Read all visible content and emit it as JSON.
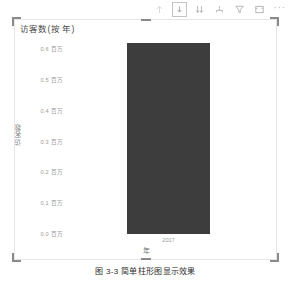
{
  "toolbar": {
    "buttons": [
      {
        "name": "drill-up-icon",
        "label": "向上钻取",
        "state": "faint"
      },
      {
        "name": "drill-down-icon",
        "label": "向下钻取",
        "state": "active"
      },
      {
        "name": "expand-all-down-icon",
        "label": "展开下一级",
        "state": "normal"
      },
      {
        "name": "drill-hierarchy-icon",
        "label": "下一级别",
        "state": "normal"
      },
      {
        "name": "filter-icon",
        "label": "筛选器",
        "state": "normal"
      },
      {
        "name": "focus-mode-icon",
        "label": "聚焦模式",
        "state": "normal"
      },
      {
        "name": "more-options-icon",
        "label": "更多选项",
        "state": "normal"
      }
    ],
    "more_glyph": "···"
  },
  "visual": {
    "title": "访客数(按 年)",
    "selected": true
  },
  "chart_data": {
    "type": "bar",
    "title": "访客数(按 年)",
    "xlabel": "年",
    "ylabel": "访客数",
    "categories": [
      "2017"
    ],
    "values": [
      0.62
    ],
    "series": [
      {
        "name": "访客数",
        "values": [
          0.62
        ]
      }
    ],
    "ylim": [
      0.0,
      0.65
    ],
    "unit_suffix": "百万",
    "ytick_values": [
      0.6,
      0.5,
      0.4,
      0.3,
      0.2,
      0.1,
      0.0
    ],
    "yticks": [
      "0.6 百万",
      "0.5 百万",
      "0.4 百万",
      "0.3 百万",
      "0.2 百万",
      "0.1 百万",
      "0.0 百万"
    ],
    "bar_color": "#3d3d3d",
    "grid": false,
    "legend": "none"
  },
  "caption": "图 3-3  简单柱形图显示效果"
}
